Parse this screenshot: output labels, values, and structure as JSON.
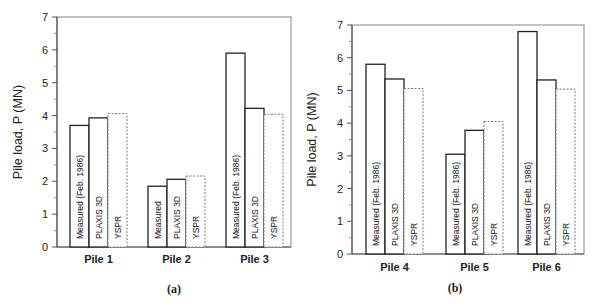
{
  "chart_data": [
    {
      "type": "bar",
      "panel_label": "(a)",
      "title": "",
      "xlabel": "",
      "ylabel": "Pile load, P (MN)",
      "ylim": [
        0,
        7
      ],
      "yticks": [
        0,
        1,
        2,
        3,
        4,
        5,
        6,
        7
      ],
      "grid": false,
      "legend": "none (labels written inside bars)",
      "categories": [
        "Pile 1",
        "Pile 2",
        "Pile 3"
      ],
      "series": [
        {
          "name": "Measured (Feb. 1986)",
          "style": "solid",
          "values": [
            3.7,
            1.85,
            5.9
          ],
          "bar_labels": [
            "Measured (Feb. 1986)",
            "Measured",
            "Measured (Feb. 1986)"
          ]
        },
        {
          "name": "PLAXIS 3D",
          "style": "solid",
          "values": [
            3.93,
            2.06,
            4.22
          ],
          "bar_labels": [
            "PLAXIS 3D",
            "PLAXIS 3D",
            "PLAXIS 3D"
          ]
        },
        {
          "name": "YSPR",
          "style": "dashed",
          "values": [
            4.06,
            2.16,
            4.04
          ],
          "bar_labels": [
            "YSPR",
            "YSPR",
            "YSPR"
          ]
        }
      ]
    },
    {
      "type": "bar",
      "panel_label": "(b)",
      "title": "",
      "xlabel": "",
      "ylabel": "Pile load, P (MN)",
      "ylim": [
        0,
        7
      ],
      "yticks": [
        0,
        1,
        2,
        3,
        4,
        5,
        6,
        7
      ],
      "grid": false,
      "legend": "none (labels written inside bars)",
      "categories": [
        "Pile 4",
        "Pile 5",
        "Pile 6"
      ],
      "series": [
        {
          "name": "Measured (Feb. 1986)",
          "style": "solid",
          "values": [
            5.8,
            3.05,
            6.8
          ],
          "bar_labels": [
            "Measured (Feb. 1986)",
            "Measured (Feb. 1986)",
            "Measured (Feb. 1986)"
          ]
        },
        {
          "name": "PLAXIS 3D",
          "style": "solid",
          "values": [
            5.35,
            3.78,
            5.32
          ],
          "bar_labels": [
            "PLAXIS 3D",
            "PLAXIS 3D",
            "PLAXIS 3D"
          ]
        },
        {
          "name": "YSPR",
          "style": "dashed",
          "values": [
            5.06,
            4.05,
            5.04
          ],
          "bar_labels": [
            "YSPR",
            "YSPR",
            "YSPR"
          ]
        }
      ]
    }
  ]
}
